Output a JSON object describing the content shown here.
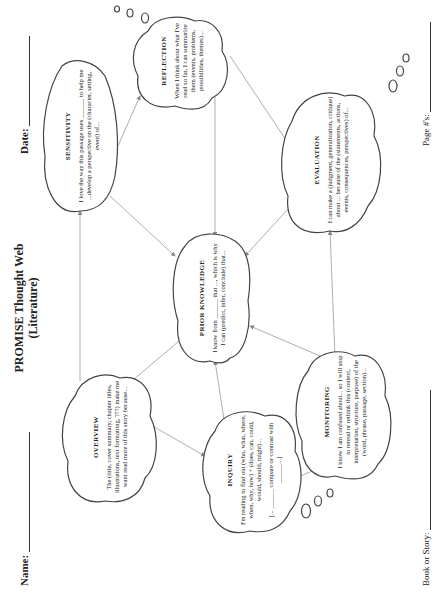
{
  "header": {
    "name_label": "Name:",
    "date_label": "Date:",
    "title_line1": "PROMISE Thought Web",
    "title_line2": "(Literature)"
  },
  "footer": {
    "book_label": "Book or Story:",
    "page_label": "Page #'s:"
  },
  "clouds": {
    "sensitivity": {
      "heading": "SENSITIVITY",
      "text": "I love the way this passage uses ______ to help me ...develop a perspective on the (character, setting, event) of..."
    },
    "reflection": {
      "heading": "REFLECTION",
      "text": "When I think about what I've read so far, I can summarize them (events, problems, possibilities, themes)..."
    },
    "overview": {
      "heading": "OVERVIEW",
      "text": "The (title, cover summary, chapter titles, illustrations, text formatting, ???) make me want read more of this story because..."
    },
    "prior_knowledge": {
      "heading": "PRIOR KNOWLEDGE",
      "text": "I know from ______ that ..., which is why I can (predict, infer, conclude) that..."
    },
    "evaluation": {
      "heading": "EVALUATION",
      "text": "I can make a (judgment, generalization, critique) about ... because of the (statements, actions, events, consequences, perspectives) of..."
    },
    "inquiry": {
      "heading": "INQUIRY",
      "text": "I'm reading to find out (who, what, where, when, why, how) + (does, can, could, would, should, might)...",
      "text2": "[... ______ compare or contrast with ______...]"
    },
    "monitoring": {
      "heading": "MONITORING",
      "text": "I know I am confused about... so I will stop to reread or rethink this (context, interpretation, structure, purpose) of the (word, phrase, passage, section)..."
    }
  },
  "orientation": "rotated 90° counter-clockwise (landscape worksheet)"
}
